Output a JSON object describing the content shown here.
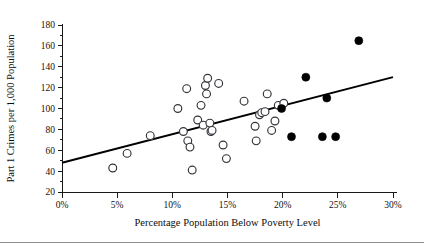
{
  "chart_data": {
    "type": "scatter",
    "title": "",
    "xlabel": "Percentage Population Below Poverty Level",
    "ylabel": "Part 1 Crimes per 1,000 Population",
    "xlim": [
      0,
      30
    ],
    "ylim": [
      20,
      180
    ],
    "grid": false,
    "legend_position": "none",
    "xticks": [
      0,
      5,
      10,
      15,
      20,
      25,
      30
    ],
    "xtick_labels": [
      "0%",
      "5%",
      "10%",
      "15%",
      "20%",
      "25%",
      "30%"
    ],
    "yticks": [
      20,
      40,
      60,
      80,
      100,
      120,
      140,
      160,
      180
    ],
    "ytick_labels": [
      "20",
      "40",
      "60",
      "80",
      "100",
      "120",
      "140",
      "160",
      "180"
    ],
    "minor_ytick_count_between": 1,
    "series": [
      {
        "name": "Open circle observations",
        "marker": "open-circle",
        "color": "#33333a",
        "points": [
          [
            4.6,
            43
          ],
          [
            5.9,
            57
          ],
          [
            8.0,
            74
          ],
          [
            10.5,
            100
          ],
          [
            11.0,
            78
          ],
          [
            11.3,
            119
          ],
          [
            11.4,
            69
          ],
          [
            11.6,
            63
          ],
          [
            11.8,
            41
          ],
          [
            12.3,
            89
          ],
          [
            12.6,
            103
          ],
          [
            12.8,
            84
          ],
          [
            13.0,
            122
          ],
          [
            13.1,
            114
          ],
          [
            13.2,
            129
          ],
          [
            13.4,
            86
          ],
          [
            13.5,
            78
          ],
          [
            13.6,
            79
          ],
          [
            14.2,
            124
          ],
          [
            14.6,
            65
          ],
          [
            14.9,
            52
          ],
          [
            16.5,
            107
          ],
          [
            17.5,
            83
          ],
          [
            17.6,
            69
          ],
          [
            17.9,
            94
          ],
          [
            18.1,
            96
          ],
          [
            18.4,
            97
          ],
          [
            18.6,
            114
          ],
          [
            19.0,
            79
          ],
          [
            19.3,
            88
          ],
          [
            19.6,
            103
          ],
          [
            20.1,
            105
          ]
        ]
      },
      {
        "name": "Filled circle observations",
        "marker": "filled-circle",
        "color": "#000000",
        "points": [
          [
            19.9,
            100
          ],
          [
            20.8,
            73
          ],
          [
            22.1,
            130
          ],
          [
            23.6,
            73
          ],
          [
            24.0,
            110
          ],
          [
            24.8,
            73
          ],
          [
            26.9,
            165
          ]
        ]
      }
    ],
    "trendline": {
      "type": "linear-fit",
      "color": "#000000",
      "x_start": 0,
      "y_start": 48,
      "x_end": 30,
      "y_end": 130
    }
  }
}
